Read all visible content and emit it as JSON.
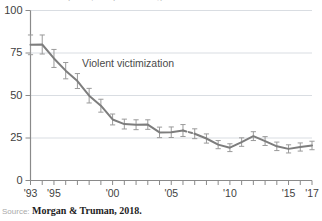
{
  "chart_data": {
    "type": "line",
    "title": "Rate per 1,000 persons age 12 or older",
    "xlabel": "",
    "ylabel": "",
    "ylim": [
      0,
      100
    ],
    "yticks": [
      0,
      25,
      50,
      75,
      100
    ],
    "ytick_labels": [
      "0",
      "25",
      "50",
      "75",
      "100"
    ],
    "xlim": [
      1993,
      2017
    ],
    "xticks": [
      1993,
      1994,
      1995,
      1996,
      1997,
      1998,
      1999,
      2000,
      2001,
      2002,
      2003,
      2004,
      2005,
      2006,
      2007,
      2008,
      2009,
      2010,
      2011,
      2012,
      2013,
      2014,
      2015,
      2016,
      2017
    ],
    "xtick_labels": [
      "'93",
      "",
      "'95",
      "",
      "",
      "",
      "",
      "'00",
      "",
      "",
      "",
      "",
      "'05",
      "",
      "",
      "",
      "",
      "'10",
      "",
      "",
      "",
      "",
      "'15",
      "",
      "'17"
    ],
    "grid": "horizontal",
    "legend_position": "inline-annotation",
    "annotations": [
      {
        "text": "Violent victimization",
        "x": 1997.4,
        "y": 67
      }
    ],
    "series": [
      {
        "name": "Violent victimization",
        "x": [
          1993,
          1994,
          1995,
          1996,
          1997,
          1998,
          1999,
          2000,
          2001,
          2002,
          2003,
          2004,
          2005,
          2006,
          2007,
          2008,
          2009,
          2010,
          2011,
          2012,
          2013,
          2014,
          2015,
          2016,
          2017
        ],
        "values": [
          79.8,
          80.0,
          71.8,
          64.6,
          58.5,
          49.9,
          44.0,
          35.9,
          33.2,
          32.8,
          32.9,
          28.3,
          28.4,
          29.4,
          27.5,
          24.7,
          21.1,
          19.3,
          22.6,
          26.1,
          23.2,
          20.1,
          18.6,
          19.7,
          20.6
        ],
        "error_low": [
          74.0,
          74.4,
          66.5,
          59.8,
          54.1,
          45.6,
          40.2,
          32.7,
          30.3,
          29.9,
          30.1,
          25.2,
          25.3,
          25.9,
          24.6,
          22.0,
          18.7,
          17.0,
          20.1,
          23.5,
          20.6,
          17.6,
          16.2,
          17.3,
          18.1
        ],
        "error_high": [
          85.6,
          85.6,
          77.1,
          69.4,
          62.9,
          54.2,
          47.8,
          39.1,
          36.1,
          35.7,
          35.7,
          31.4,
          31.5,
          32.9,
          30.4,
          27.4,
          23.5,
          21.6,
          25.1,
          28.7,
          25.8,
          22.6,
          21.0,
          22.1,
          23.1
        ],
        "color": "#7d7d7d",
        "dashed_segments": [
          [
            2006,
            2007
          ]
        ]
      }
    ]
  },
  "source": {
    "prefix": "Source:",
    "citation": "Morgan & Truman, 2018."
  }
}
